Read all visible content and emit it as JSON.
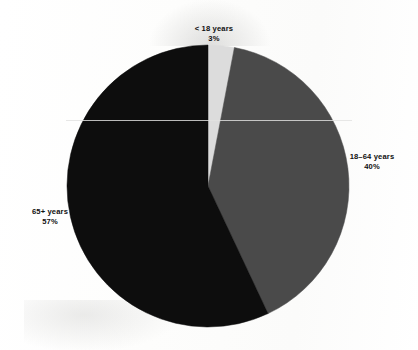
{
  "figure": {
    "background_color": "#fefefe",
    "geometry": {
      "center_x": 208,
      "center_y": 186,
      "radius": 141,
      "start_angle_deg": 0
    }
  },
  "chart_data": {
    "type": "pie",
    "title": "",
    "labels": [
      "< 18 years",
      "18–64 years",
      "65+ years"
    ],
    "values": [
      3,
      40,
      57
    ],
    "value_unit": "%",
    "display_percentages": [
      "3%",
      "40%",
      "57%"
    ],
    "colors": [
      "#dcdcdc",
      "#4a4a4a",
      "#0d0d0d"
    ],
    "legend": "none",
    "grid": false,
    "label_placement": "outside",
    "slices": [
      {
        "name": "under-18",
        "label": "< 18 years",
        "percent_text": "3%",
        "value": 3,
        "color": "#dcdcdc",
        "start_angle_deg": 0,
        "end_angle_deg": 10.8
      },
      {
        "name": "18-64",
        "label": "18–64 years",
        "percent_text": "40%",
        "value": 40,
        "color": "#4a4a4a",
        "start_angle_deg": 10.8,
        "end_angle_deg": 154.8
      },
      {
        "name": "65-plus",
        "label": "65+ years",
        "percent_text": "57%",
        "value": 57,
        "color": "#0d0d0d",
        "start_angle_deg": 154.8,
        "end_angle_deg": 360
      }
    ]
  }
}
